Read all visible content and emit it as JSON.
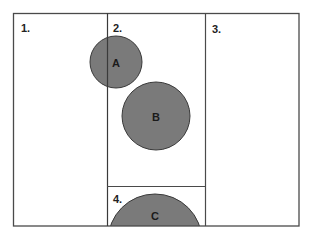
{
  "diagram": {
    "colors": {
      "stroke": "#4a4a4a",
      "circle_fill": "#7a7a7a",
      "background": "#ffffff"
    },
    "zones": [
      {
        "id": "1",
        "label": "1."
      },
      {
        "id": "2",
        "label": "2."
      },
      {
        "id": "3",
        "label": "3."
      },
      {
        "id": "4",
        "label": "4."
      }
    ],
    "circles": [
      {
        "id": "A",
        "label": "A"
      },
      {
        "id": "B",
        "label": "B"
      },
      {
        "id": "C",
        "label": "C"
      }
    ]
  }
}
